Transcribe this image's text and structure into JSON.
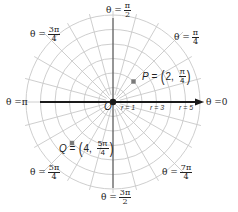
{
  "diagram": {
    "origin_label": "O",
    "colors": {
      "grid": "#c8c8c8",
      "axis": "#1a1a1a",
      "point": "#7a7a7a",
      "text": "#222222"
    },
    "angle_labels": [
      {
        "id": "theta-0",
        "prefix": "θ = ",
        "value": "0",
        "num": "",
        "den": ""
      },
      {
        "id": "theta-pi-4",
        "prefix": "θ = ",
        "value": "",
        "num": "π",
        "den": "4"
      },
      {
        "id": "theta-pi-2",
        "prefix": "θ = ",
        "value": "",
        "num": "π",
        "den": "2"
      },
      {
        "id": "theta-3pi-4",
        "prefix": "θ = ",
        "value": "",
        "num": "3π",
        "den": "4"
      },
      {
        "id": "theta-pi",
        "prefix": "θ = ",
        "value": "π",
        "num": "",
        "den": ""
      },
      {
        "id": "theta-5pi-4",
        "prefix": "θ = ",
        "value": "",
        "num": "5π",
        "den": "4"
      },
      {
        "id": "theta-3pi-2",
        "prefix": "θ = ",
        "value": "",
        "num": "3π",
        "den": "2"
      },
      {
        "id": "theta-7pi-4",
        "prefix": "θ = ",
        "value": "",
        "num": "7π",
        "den": "4"
      }
    ],
    "radius_labels": [
      "r = 1",
      "r = 3",
      "r = 5"
    ],
    "points": [
      {
        "name": "P",
        "eq": " = ",
        "r": "2",
        "theta_num": "π",
        "theta_den": "4"
      },
      {
        "name": "Q",
        "eq": " = ",
        "r": "4",
        "theta_num": "5π",
        "theta_den": "4"
      }
    ]
  }
}
